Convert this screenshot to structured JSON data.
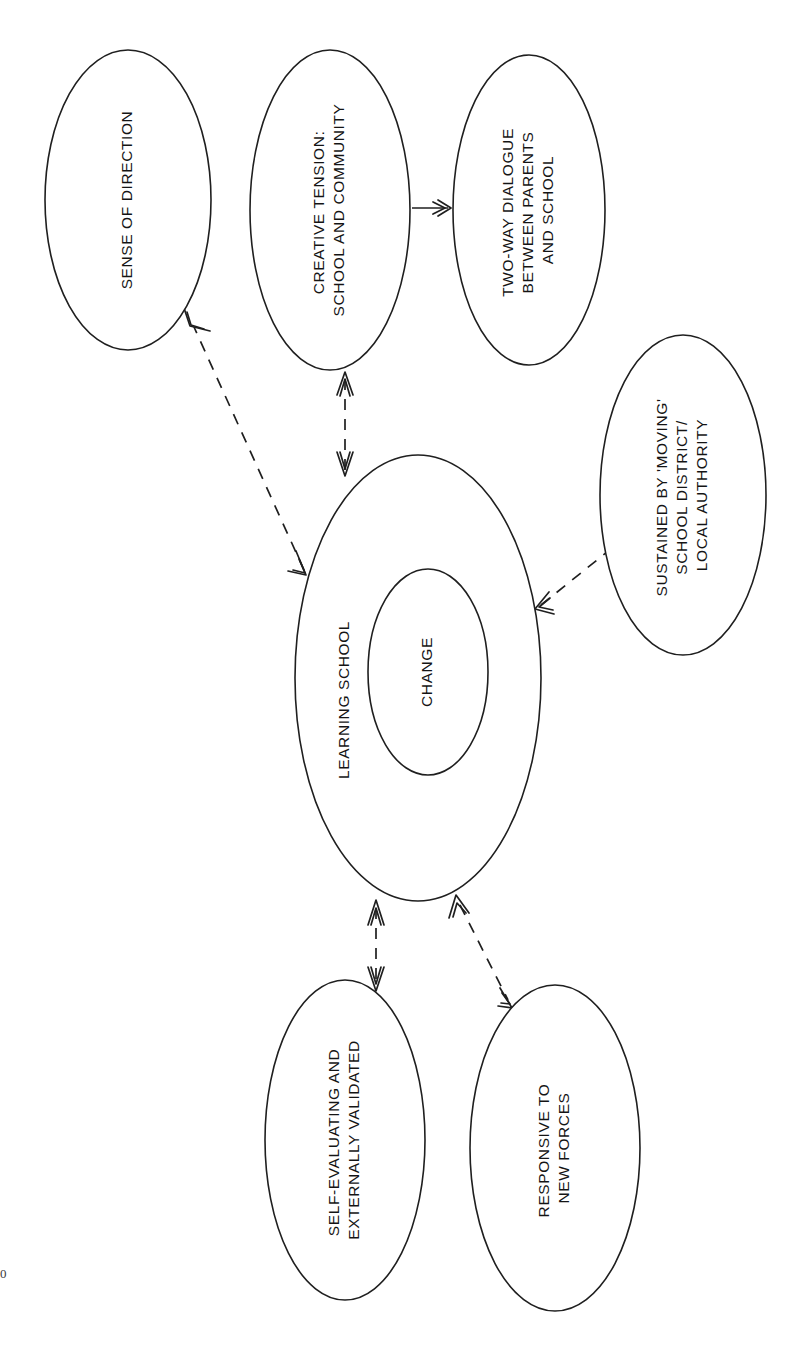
{
  "diagram": {
    "orientation": "rotated-90-ccw",
    "nodes": [
      {
        "id": "sense-of-direction",
        "lines": [
          "SENSE OF DIRECTION"
        ],
        "cx": 128,
        "cy": 200,
        "rx": 83,
        "ry": 150
      },
      {
        "id": "creative-tension",
        "lines": [
          "CREATIVE TENSION:",
          "SCHOOL AND COMMUNITY"
        ],
        "cx": 330,
        "cy": 210,
        "rx": 80,
        "ry": 160
      },
      {
        "id": "two-way-dialogue",
        "lines": [
          "TWO-WAY DIALOGUE",
          "BETWEEN PARENTS",
          "AND SCHOOL"
        ],
        "cx": 529,
        "cy": 210,
        "rx": 76,
        "ry": 155
      },
      {
        "id": "sustained-by-moving-school",
        "lines": [
          "SUSTAINED BY 'MOVING'",
          "SCHOOL DISTRICT/",
          "LOCAL AUTHORITY"
        ],
        "cx": 683,
        "cy": 495,
        "rx": 83,
        "ry": 160
      },
      {
        "id": "learning-school",
        "lines": [
          "LEARNING SCHOOL"
        ],
        "cx": 418,
        "cy": 678,
        "rx": 123,
        "ry": 223
      },
      {
        "id": "change",
        "lines": [
          "CHANGE"
        ],
        "cx": 428,
        "cy": 672,
        "rx": 60,
        "ry": 103
      },
      {
        "id": "self-evaluating",
        "lines": [
          "SELF-EVALUATING AND",
          "EXTERNALLY VALIDATED"
        ],
        "cx": 345,
        "cy": 1140,
        "rx": 80,
        "ry": 160
      },
      {
        "id": "responsive-to-new-forces",
        "lines": [
          "RESPONSIVE TO",
          "NEW FORCES"
        ],
        "cx": 555,
        "cy": 1148,
        "rx": 85,
        "ry": 163
      }
    ],
    "connectors": [
      {
        "id": "creative-tension-to-two-way-dialogue",
        "from": "creative-tension",
        "to": "two-way-dialogue",
        "style": "solid",
        "heads": "single"
      },
      {
        "id": "learning-school-to-sense-of-direction",
        "from": "learning-school",
        "to": "sense-of-direction",
        "style": "dashed",
        "heads": "double"
      },
      {
        "id": "learning-school-to-creative-tension",
        "from": "learning-school",
        "to": "creative-tension",
        "style": "dashed",
        "heads": "double"
      },
      {
        "id": "learning-school-to-sustained-by",
        "from": "learning-school",
        "to": "sustained-by-moving-school",
        "style": "dashed",
        "heads": "double"
      },
      {
        "id": "learning-school-to-self-evaluating",
        "from": "learning-school",
        "to": "self-evaluating",
        "style": "dashed",
        "heads": "double"
      },
      {
        "id": "learning-school-to-responsive",
        "from": "learning-school",
        "to": "responsive-to-new-forces",
        "style": "dashed",
        "heads": "double"
      }
    ],
    "colors": {
      "stroke": "#1f1f1f",
      "fill": "#ffffff",
      "text": "#141414"
    }
  },
  "page_mark": {
    "text": "0"
  }
}
